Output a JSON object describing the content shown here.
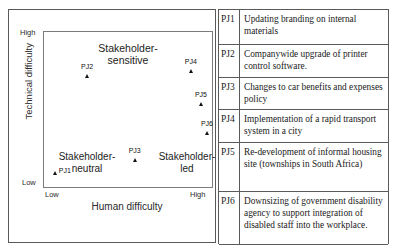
{
  "chart_data": {
    "type": "scatter",
    "title": "",
    "xlabel": "Human difficulty",
    "ylabel": "Technical difficulty",
    "x_ticks": [
      "Low",
      "High"
    ],
    "y_ticks": [
      "High",
      "Low"
    ],
    "xlim": [
      0,
      1
    ],
    "ylim": [
      0,
      1
    ],
    "grid": false,
    "legend": "none",
    "zones": [
      {
        "name": "stakeholder-sensitive",
        "label": "Stakeholder-\nsensitive"
      },
      {
        "name": "stakeholder-neutral",
        "label": "Stakeholder-\nneutral"
      },
      {
        "name": "stakeholder-led",
        "label": "Stakeholder-\nled"
      }
    ],
    "shape": {
      "type": "inverted-triangle",
      "fill": "#e9e9e9",
      "stroke": "#8c8c8c",
      "vertices_norm": [
        [
          0.01,
          0.08
        ],
        [
          0.99,
          0.08
        ],
        [
          0.545,
          1.0
        ]
      ]
    },
    "points": [
      {
        "label": "PJ1",
        "x": 0.075,
        "y": 0.08,
        "label_side": "right"
      },
      {
        "label": "PJ2",
        "x": 0.265,
        "y": 0.7,
        "label_side": "above"
      },
      {
        "label": "PJ3",
        "x": 0.545,
        "y": 0.165,
        "label_side": "above"
      },
      {
        "label": "PJ4",
        "x": 0.875,
        "y": 0.735,
        "label_side": "above"
      },
      {
        "label": "PJ5",
        "x": 0.935,
        "y": 0.525,
        "label_side": "above"
      },
      {
        "label": "PJ6",
        "x": 0.97,
        "y": 0.34,
        "label_side": "above"
      }
    ]
  },
  "table": {
    "rows": [
      {
        "id": "PJ1",
        "desc": "Updating branding on internal materials"
      },
      {
        "id": "PJ2",
        "desc": "Companywide upgrade of printer control software."
      },
      {
        "id": "PJ3",
        "desc": "Changes to car benefits and expenses policy"
      },
      {
        "id": "PJ4",
        "desc": "Implementation of a rapid transport system in a city"
      },
      {
        "id": "PJ5",
        "desc": "Re-development of informal housing site (townships in South Africa)"
      },
      {
        "id": "PJ6",
        "desc": "Downsizing of government disability agency to support integration of disabled staff into the workplace."
      }
    ]
  },
  "colors": {
    "border": "#5a5a5a",
    "triangle_fill": "#e9e9e9",
    "triangle_stroke": "#8c8c8c",
    "text": "#1a1a1a"
  }
}
